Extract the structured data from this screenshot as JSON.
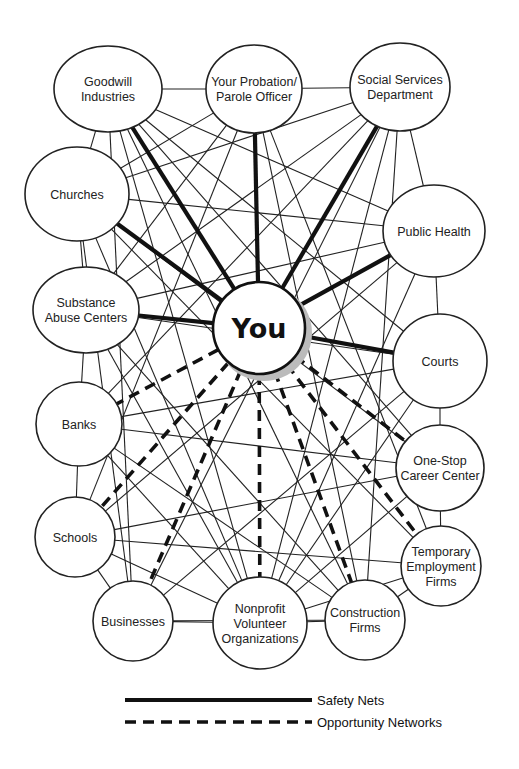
{
  "diagram": {
    "type": "network",
    "center": {
      "id": "you",
      "label": "You"
    },
    "nodes": [
      {
        "id": "goodwill",
        "lines": [
          "Goodwill",
          "Industries"
        ]
      },
      {
        "id": "probation",
        "lines": [
          "Your Probation/",
          "Parole Officer"
        ]
      },
      {
        "id": "social",
        "lines": [
          "Social Services",
          "Department"
        ]
      },
      {
        "id": "churches",
        "lines": [
          "Churches"
        ]
      },
      {
        "id": "publichealth",
        "lines": [
          "Public Health"
        ]
      },
      {
        "id": "substance",
        "lines": [
          "Substance",
          "Abuse Centers"
        ]
      },
      {
        "id": "courts",
        "lines": [
          "Courts"
        ]
      },
      {
        "id": "banks",
        "lines": [
          "Banks"
        ]
      },
      {
        "id": "onestop",
        "lines": [
          "One-Stop",
          "Career Center"
        ]
      },
      {
        "id": "schools",
        "lines": [
          "Schools"
        ]
      },
      {
        "id": "temporary",
        "lines": [
          "Temporary",
          "Employment",
          "Firms"
        ]
      },
      {
        "id": "businesses",
        "lines": [
          "Businesses"
        ]
      },
      {
        "id": "nonprofit",
        "lines": [
          "Nonprofit",
          "Volunteer",
          "Organizations"
        ]
      },
      {
        "id": "construction",
        "lines": [
          "Construction",
          "Firms"
        ]
      }
    ],
    "safety_nets": [
      "goodwill",
      "probation",
      "social",
      "churches",
      "publichealth",
      "substance",
      "courts"
    ],
    "opportunity_networks": [
      "banks",
      "schools",
      "businesses",
      "nonprofit",
      "construction",
      "temporary",
      "onestop"
    ],
    "ring_links": [
      [
        "goodwill",
        "probation"
      ],
      [
        "probation",
        "social"
      ],
      [
        "social",
        "publichealth"
      ],
      [
        "publichealth",
        "courts"
      ],
      [
        "courts",
        "onestop"
      ],
      [
        "onestop",
        "temporary"
      ],
      [
        "temporary",
        "construction"
      ],
      [
        "construction",
        "nonprofit"
      ],
      [
        "nonprofit",
        "businesses"
      ],
      [
        "businesses",
        "schools"
      ],
      [
        "schools",
        "banks"
      ],
      [
        "banks",
        "substance"
      ],
      [
        "substance",
        "churches"
      ],
      [
        "churches",
        "goodwill"
      ]
    ],
    "cross_links": [
      [
        "goodwill",
        "publichealth"
      ],
      [
        "goodwill",
        "courts"
      ],
      [
        "goodwill",
        "onestop"
      ],
      [
        "goodwill",
        "construction"
      ],
      [
        "goodwill",
        "nonprofit"
      ],
      [
        "goodwill",
        "businesses"
      ],
      [
        "probation",
        "churches"
      ],
      [
        "probation",
        "substance"
      ],
      [
        "probation",
        "schools"
      ],
      [
        "probation",
        "construction"
      ],
      [
        "probation",
        "temporary"
      ],
      [
        "social",
        "churches"
      ],
      [
        "social",
        "substance"
      ],
      [
        "social",
        "banks"
      ],
      [
        "social",
        "nonprofit"
      ],
      [
        "social",
        "construction"
      ],
      [
        "social",
        "businesses"
      ],
      [
        "churches",
        "publichealth"
      ],
      [
        "churches",
        "onestop"
      ],
      [
        "churches",
        "temporary"
      ],
      [
        "churches",
        "nonprofit"
      ],
      [
        "churches",
        "businesses"
      ],
      [
        "publichealth",
        "substance"
      ],
      [
        "publichealth",
        "schools"
      ],
      [
        "publichealth",
        "nonprofit"
      ],
      [
        "substance",
        "courts"
      ],
      [
        "substance",
        "construction"
      ],
      [
        "substance",
        "nonprofit"
      ],
      [
        "courts",
        "banks"
      ],
      [
        "courts",
        "businesses"
      ],
      [
        "courts",
        "nonprofit"
      ],
      [
        "banks",
        "onestop"
      ],
      [
        "banks",
        "nonprofit"
      ],
      [
        "banks",
        "construction"
      ],
      [
        "onestop",
        "schools"
      ],
      [
        "onestop",
        "nonprofit"
      ],
      [
        "schools",
        "temporary"
      ],
      [
        "schools",
        "nonprofit"
      ],
      [
        "temporary",
        "nonprofit"
      ],
      [
        "businesses",
        "construction"
      ]
    ]
  },
  "legend": {
    "safety_label": "Safety Nets",
    "opportunity_label": "Opportunity Networks"
  }
}
